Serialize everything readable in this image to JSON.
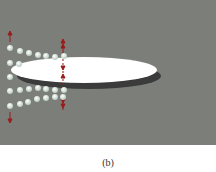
{
  "figure": {
    "caption": "(b)",
    "panel_color": "#7b7e79",
    "ellipse": {
      "cx": 84,
      "cy": 70,
      "rx": 73,
      "ry": 13,
      "fill": "#ffffff"
    },
    "shadow": {
      "cx": 88,
      "cy": 76,
      "rx": 73,
      "ry": 13,
      "fill": "#3a3b3a"
    },
    "arrow_color": "#9b1b1b",
    "dot_color": "#d8e6de",
    "dots": [
      [
        10,
        48
      ],
      [
        20,
        51
      ],
      [
        29,
        53
      ],
      [
        38,
        55
      ],
      [
        46,
        56
      ],
      [
        55,
        57
      ],
      [
        64,
        56
      ],
      [
        10,
        63
      ],
      [
        19,
        64
      ],
      [
        10,
        77
      ],
      [
        10,
        91
      ],
      [
        20,
        90
      ],
      [
        29,
        89
      ],
      [
        38,
        88
      ],
      [
        46,
        89
      ],
      [
        55,
        90
      ],
      [
        64,
        90
      ],
      [
        10,
        106
      ],
      [
        20,
        104
      ],
      [
        28,
        102
      ],
      [
        37,
        99
      ],
      [
        46,
        98
      ],
      [
        55,
        97
      ],
      [
        63,
        97
      ]
    ]
  }
}
